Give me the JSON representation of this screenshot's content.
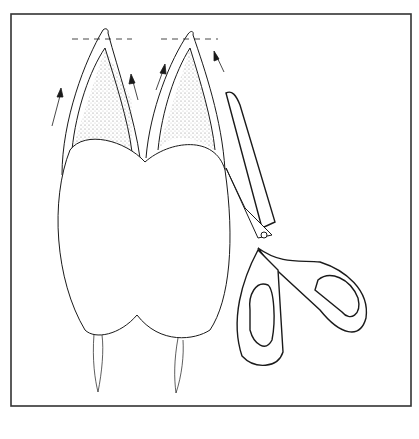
{
  "figure": {
    "title": "",
    "elements": [
      "frame",
      "cusp-left",
      "cusp-right",
      "body",
      "cut-line-left",
      "cut-line-right",
      "direction-arrows",
      "roots",
      "scissors"
    ],
    "colors": {
      "line": "#1a1a1a",
      "background": "#ffffff",
      "frame": "#333333"
    }
  }
}
